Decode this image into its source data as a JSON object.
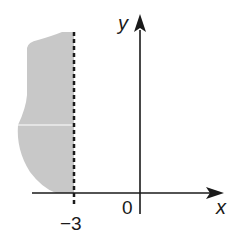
{
  "diagram": {
    "type": "inequality-region-graph",
    "axes": {
      "x_label": "x",
      "y_label": "y",
      "origin_label": "0"
    },
    "boundary": {
      "value_label": "−3",
      "style": "dashed",
      "equation": "x = -3"
    },
    "region": {
      "side": "left",
      "inequality": "x < -3",
      "fill_color": "#c8c8c8"
    },
    "colors": {
      "axis": "#1a1a1a",
      "shade": "#c8c8c8",
      "background": "#ffffff"
    }
  }
}
